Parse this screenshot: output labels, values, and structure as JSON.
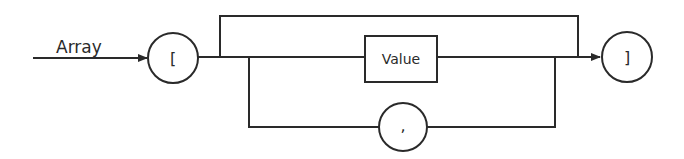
{
  "diagram": {
    "type": "railroad-syntax-diagram",
    "title": "Array",
    "nodes": [
      {
        "id": "open-bracket",
        "shape": "circle",
        "kind": "terminal",
        "label": "["
      },
      {
        "id": "value",
        "shape": "rectangle",
        "kind": "nonterminal",
        "label": "Value"
      },
      {
        "id": "comma",
        "shape": "circle",
        "kind": "terminal",
        "label": ","
      },
      {
        "id": "close-bracket",
        "shape": "circle",
        "kind": "terminal",
        "label": "]"
      }
    ],
    "edges": [
      {
        "from": "entry",
        "to": "open-bracket",
        "arrow": true
      },
      {
        "from": "open-bracket",
        "to": "value"
      },
      {
        "from": "open-bracket",
        "to": "close-bracket",
        "path": "bypass-top",
        "meaning": "empty array"
      },
      {
        "from": "value",
        "to": "close-bracket",
        "arrow": true
      },
      {
        "from": "value",
        "to": "comma",
        "path": "loop-bottom",
        "meaning": "repeat"
      },
      {
        "from": "comma",
        "to": "value",
        "path": "loop-bottom"
      }
    ],
    "colors": {
      "stroke": "#2a2a2a",
      "background": "#ffffff"
    }
  }
}
